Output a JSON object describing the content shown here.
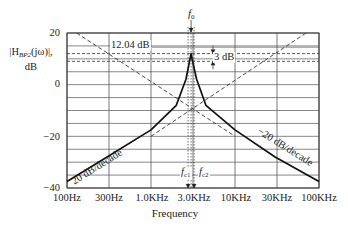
{
  "chart_data": {
    "type": "line",
    "title": "",
    "xlabel": "Frequency",
    "ylabel": "|H_BP2(jω)|, dB",
    "xscale": "log",
    "xlim": [
      100,
      100000
    ],
    "ylim": [
      -40,
      20
    ],
    "grid": true,
    "x_ticks": [
      "100Hz",
      "300Hz",
      "1.0KHz",
      "3.0KHz",
      "10KHz",
      "30KHz",
      "100KHz"
    ],
    "y_ticks": [
      "20",
      "0",
      "−20",
      "−40"
    ],
    "y_tick_values": [
      20,
      0,
      -20,
      -40
    ],
    "center_frequency_hz": 3000,
    "peak_db": 12.04,
    "half_power_db": 9.04,
    "series": [
      {
        "name": "magnitude response",
        "style": "solid-bold",
        "x": [
          100,
          300,
          1000,
          2000,
          2600,
          2900,
          3000,
          3100,
          3500,
          4500,
          10000,
          30000,
          100000
        ],
        "y": [
          -37.5,
          -28,
          -17.5,
          -8,
          2,
          9.5,
          12.04,
          9.5,
          2,
          -8,
          -17.5,
          -28,
          -37.5
        ]
      },
      {
        "name": "low-frequency asymptote",
        "style": "dashed",
        "x": [
          130,
          10000
        ],
        "y": [
          20,
          -20
        ]
      },
      {
        "name": "high-frequency asymptote",
        "style": "dashed",
        "x": [
          1000,
          70000
        ],
        "y": [
          -20,
          20
        ]
      }
    ],
    "annotations": [
      {
        "text": "f0",
        "x": 3000,
        "position": "top"
      },
      {
        "text": "12.04 dB",
        "y": 12.04
      },
      {
        "text": "3 dB",
        "y_range": [
          9.04,
          12.04
        ]
      },
      {
        "text": "20 dB/decade",
        "slope": "+20"
      },
      {
        "text": "−20 dB/decade",
        "slope": "-20"
      },
      {
        "text": "fc1",
        "position": "bottom-left of f0"
      },
      {
        "text": "fc2",
        "position": "bottom-right of f0"
      }
    ]
  },
  "labels": {
    "ylabel_main": "|H",
    "ylabel_sub": "BP2",
    "ylabel_arg": "(jω)|,",
    "ylabel_unit": "dB",
    "xlabel": "Frequency",
    "f0": "f",
    "f0_sub": "0",
    "fc1": "f",
    "fc1_sub": "c1",
    "fc2": "f",
    "fc2_sub": "c2",
    "peak": "12.04 dB",
    "bw": "3 dB",
    "slope_up": "20 dB/decade",
    "slope_down": "−20 dB/decade",
    "yt0": "20",
    "yt1": "0",
    "yt2": "−20",
    "yt3": "−40",
    "xt0": "100Hz",
    "xt1": "300Hz",
    "xt2": "1.0KHz",
    "xt3": "3.0KHz",
    "xt4": "10KHz",
    "xt5": "30KHz",
    "xt6": "100KHz"
  },
  "colors": {
    "grid": "#555555",
    "curve": "#111111",
    "dashed": "#333333",
    "text": "#222222"
  }
}
